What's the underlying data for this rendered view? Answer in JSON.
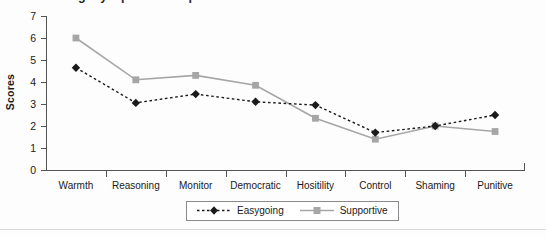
{
  "chart": {
    "title_partial": "Parenting style profile comparison",
    "ylabel": "Scores"
  },
  "legend": {
    "position": "bottom-center",
    "entries": [
      {
        "name": "Easygoing",
        "color": "#1a1a1a",
        "marker": "diamond",
        "line": "dashed"
      },
      {
        "name": "Supportive",
        "color": "#a6a6a6",
        "marker": "square",
        "line": "solid"
      }
    ]
  },
  "chart_data": {
    "type": "line",
    "title": "Parenting style profile comparison",
    "xlabel": "",
    "ylabel": "Scores",
    "ylim": [
      0,
      7
    ],
    "yticks": [
      0,
      1,
      2,
      3,
      4,
      5,
      6,
      7
    ],
    "grid": false,
    "legend_position": "bottom-center",
    "categories": [
      "Warmth",
      "Reasoning",
      "Monitor",
      "Democratic",
      "Hositility",
      "Control",
      "Shaming",
      "Punitive"
    ],
    "series": [
      {
        "name": "Easygoing",
        "color": "#1a1a1a",
        "marker": "diamond",
        "line": "dashed",
        "values": [
          4.65,
          3.05,
          3.45,
          3.1,
          2.95,
          1.7,
          2.0,
          2.5
        ]
      },
      {
        "name": "Supportive",
        "color": "#a6a6a6",
        "marker": "square",
        "line": "solid",
        "values": [
          6.0,
          4.1,
          4.3,
          3.85,
          2.35,
          1.4,
          2.0,
          1.75
        ]
      }
    ]
  }
}
